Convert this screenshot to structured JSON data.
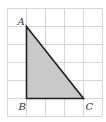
{
  "diagram": {
    "type": "right-triangle-on-grid",
    "grid": {
      "origin_x": 7,
      "origin_y": 8,
      "cell_w": 19,
      "cell_h": 18,
      "cols": 5,
      "rows": 6,
      "line_color": "#d6d6d6"
    },
    "triangle": {
      "fill": "#c9c9c9",
      "stroke": "#1f1f1f",
      "vertices": [
        {
          "name": "A",
          "grid_x": 1,
          "grid_y": 1
        },
        {
          "name": "B",
          "grid_x": 1,
          "grid_y": 5
        },
        {
          "name": "C",
          "grid_x": 4,
          "grid_y": 5
        }
      ]
    },
    "labels": {
      "A": "A",
      "B": "B",
      "C": "C"
    }
  }
}
